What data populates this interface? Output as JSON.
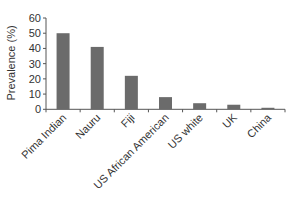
{
  "chart_data": {
    "type": "bar",
    "title": "",
    "xlabel": "",
    "ylabel": "Prevalence (%)",
    "categories": [
      "Pima Indian",
      "Nauru",
      "Fiji",
      "US African American",
      "US white",
      "UK",
      "China"
    ],
    "values": [
      50,
      41,
      22,
      8,
      4,
      3,
      1
    ],
    "ylim": [
      0,
      60
    ],
    "yticks": [
      0,
      10,
      20,
      30,
      40,
      50,
      60
    ],
    "grid": false,
    "legend": null,
    "bar_color": "#6b6b6b",
    "axis_color": "#555555"
  }
}
